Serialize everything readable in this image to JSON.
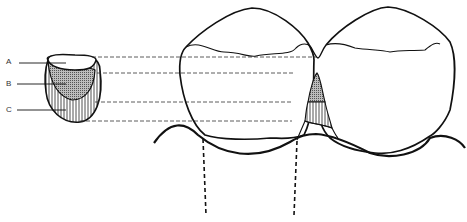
{
  "diagram": {
    "labels": [
      {
        "id": "A",
        "text": "A"
      },
      {
        "id": "B",
        "text": "B"
      },
      {
        "id": "C",
        "text": "C"
      }
    ],
    "colors": {
      "stroke": "#111111",
      "zone_b_fill": "#9a9a9a",
      "background": "#ffffff"
    }
  }
}
